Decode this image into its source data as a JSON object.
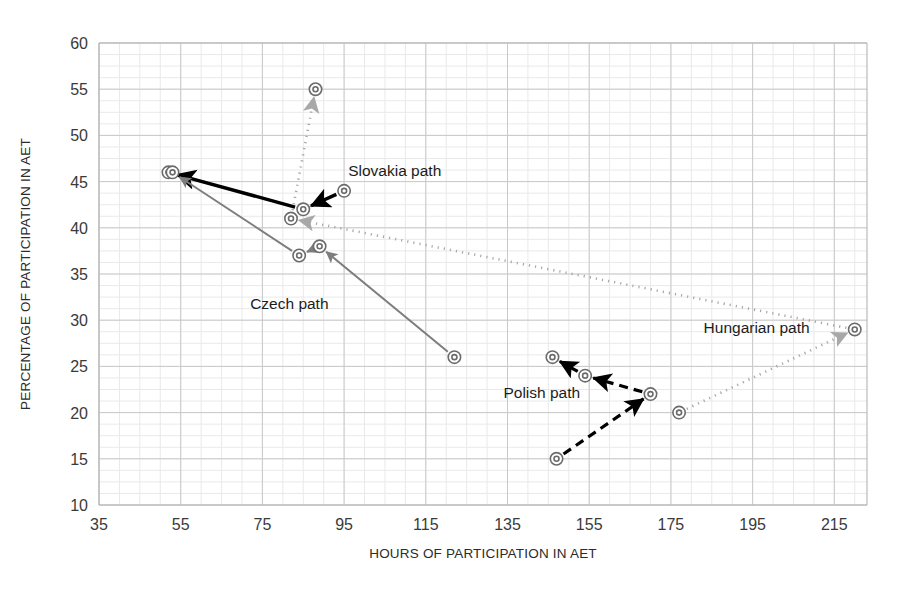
{
  "chart_data": {
    "type": "scatter",
    "title": "",
    "xlabel": "HOURS OF PARTICIPATION IN AET",
    "ylabel": "PERCENTAGE OF PARTICIPATION IN AET",
    "xlim": [
      35,
      223
    ],
    "ylim": [
      10,
      60
    ],
    "xticks": [
      35,
      55,
      75,
      95,
      115,
      135,
      155,
      175,
      195,
      215
    ],
    "yticks": [
      10,
      15,
      20,
      25,
      30,
      35,
      40,
      45,
      50,
      55,
      60
    ],
    "grid": true,
    "legend_position": "inline-annotations",
    "series": [
      {
        "name": "Slovakia path",
        "label": "Slovakia path",
        "color": "#000000",
        "line_style": "solid",
        "arrow": true,
        "points": [
          {
            "x": 95,
            "y": 44
          },
          {
            "x": 85,
            "y": 42
          },
          {
            "x": 52,
            "y": 46
          }
        ]
      },
      {
        "name": "Czech path",
        "label": "Czech path",
        "color": "#808080",
        "line_style": "solid",
        "arrow": true,
        "points": [
          {
            "x": 122,
            "y": 26
          },
          {
            "x": 89,
            "y": 38
          },
          {
            "x": 84,
            "y": 37
          },
          {
            "x": 53,
            "y": 46
          }
        ]
      },
      {
        "name": "Polish path",
        "label": "Polish path",
        "color": "#000000",
        "line_style": "dashed",
        "arrow": true,
        "points": [
          {
            "x": 147,
            "y": 15
          },
          {
            "x": 170,
            "y": 22
          },
          {
            "x": 154,
            "y": 24
          },
          {
            "x": 146,
            "y": 26
          }
        ]
      },
      {
        "name": "Hungarian path",
        "label": "Hungarian path",
        "color": "#a0a0a0",
        "line_style": "dotted",
        "arrow": true,
        "points": [
          {
            "x": 177,
            "y": 20
          },
          {
            "x": 220,
            "y": 29
          },
          {
            "x": 82,
            "y": 41
          },
          {
            "x": 88,
            "y": 55
          }
        ]
      }
    ],
    "annotations": [
      {
        "text": "Slovakia path",
        "x": 96,
        "y": 45.6
      },
      {
        "text": "Czech path",
        "x": 72,
        "y": 31.2
      },
      {
        "text": "Polish path",
        "x": 134,
        "y": 21.6
      },
      {
        "text": "Hungarian path",
        "x": 183,
        "y": 28.6
      }
    ]
  },
  "axes": {
    "x_title": "HOURS OF PARTICIPATION IN AET",
    "y_title": "PERCENTAGE OF PARTICIPATION IN AET",
    "x_tick_labels": [
      "35",
      "55",
      "75",
      "95",
      "115",
      "135",
      "155",
      "175",
      "195",
      "215"
    ],
    "y_tick_labels": [
      "10",
      "15",
      "20",
      "25",
      "30",
      "35",
      "40",
      "45",
      "50",
      "55",
      "60"
    ]
  },
  "labels": {
    "slovakia": "Slovakia path",
    "czech": "Czech path",
    "polish": "Polish path",
    "hungarian": "Hungarian path"
  },
  "colors": {
    "background": "#ffffff",
    "grid_major": "#c9c9c9",
    "grid_minor": "#e9e9e9",
    "axis": "#b4b4b4",
    "slovakia": "#000000",
    "czech": "#808080",
    "polish": "#000000",
    "hungarian": "#a0a0a0",
    "marker_stroke": "#6b6b6b"
  }
}
